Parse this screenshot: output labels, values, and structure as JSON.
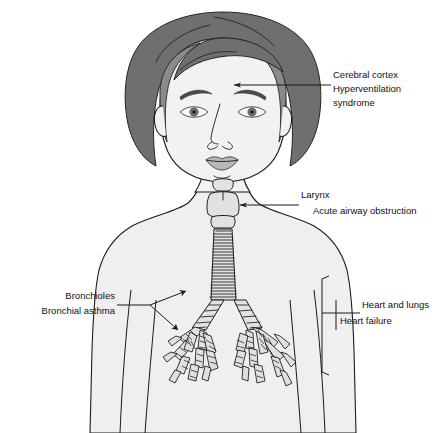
{
  "figure": {
    "background_color": "#ffffff",
    "line_color": "#1a1a1a",
    "body_fill": "#efefef",
    "hair_outer_color": "#6f6f6f",
    "hair_inner_color": "#8a8a8a"
  },
  "annotations": {
    "cerebral": {
      "anatomy_label": "Cerebral cortex",
      "condition_line1": "Hyperventilation",
      "condition_line2": "syndrome"
    },
    "larynx": {
      "anatomy_label": "Larynx",
      "condition_label": "Acute airway obstruction"
    },
    "bronchioles": {
      "anatomy_label": "Bronchioles",
      "condition_label": "Bronchial asthma"
    },
    "heart_lungs": {
      "anatomy_label": "Heart and lungs",
      "condition_label": "Heart failure"
    }
  }
}
